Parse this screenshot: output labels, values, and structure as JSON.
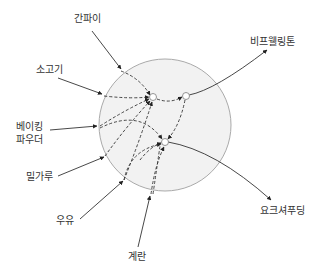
{
  "diagram": {
    "type": "neural-network-style ingredient flow",
    "colors": {
      "circle_fill": "#f2f2f2",
      "circle_stroke": "#aaaaaa",
      "line": "#333333",
      "node_fill": "#ffffff",
      "node_stroke": "#888888",
      "text": "#333333"
    },
    "inputs": [
      {
        "id": "ganpai",
        "label": "간파이"
      },
      {
        "id": "sogogi",
        "label": "소고기"
      },
      {
        "id": "baking_powder",
        "label_line1": "베이킹",
        "label_line2": "파우더"
      },
      {
        "id": "milgaru",
        "label": "밀가루"
      },
      {
        "id": "uyu",
        "label": "우유"
      },
      {
        "id": "gyeran",
        "label": "계란"
      }
    ],
    "outputs": [
      {
        "id": "beef_wellington",
        "label": "비프웰링톤"
      },
      {
        "id": "yorkshire_pudding",
        "label": "요크셔푸딩"
      }
    ],
    "hidden_nodes": [
      {
        "id": "node_a"
      },
      {
        "id": "node_b"
      },
      {
        "id": "node_c"
      }
    ]
  }
}
